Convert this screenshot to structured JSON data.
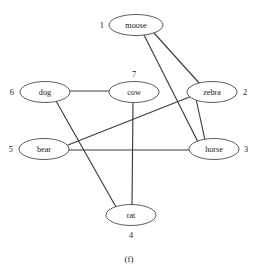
{
  "figure": {
    "caption": "(f)",
    "type": "undirected-graph",
    "width": 258,
    "height": 270,
    "background_color": "#ffffff",
    "node_stroke_color": "#4a4a4a",
    "node_fill_color": "#ffffff",
    "edge_color": "#3c3c3c"
  },
  "graph": {
    "nodes": [
      {
        "id": "moose",
        "label": "moose",
        "index": "1",
        "index_position": "left",
        "cx": 136,
        "cy": 25,
        "rx": 27,
        "ry": 10.5,
        "index_x": 104,
        "index_y": 25
      },
      {
        "id": "zebra",
        "label": "zebra",
        "index": "2",
        "index_position": "right",
        "cx": 212,
        "cy": 92,
        "rx": 25,
        "ry": 10.5,
        "index_x": 243,
        "index_y": 92
      },
      {
        "id": "horse",
        "label": "horse",
        "index": "3",
        "index_position": "right",
        "cx": 214,
        "cy": 149,
        "rx": 25,
        "ry": 10.5,
        "index_x": 244,
        "index_y": 149
      },
      {
        "id": "rat",
        "label": "rat",
        "index": "4",
        "index_position": "below",
        "cx": 131,
        "cy": 215,
        "rx": 25,
        "ry": 10.5,
        "index_x": 131,
        "index_y": 235
      },
      {
        "id": "bear",
        "label": "bear",
        "index": "5",
        "index_position": "left",
        "cx": 44,
        "cy": 149,
        "rx": 25,
        "ry": 10.5,
        "index_x": 13,
        "index_y": 149
      },
      {
        "id": "dog",
        "label": "dog",
        "index": "6",
        "index_position": "left",
        "cx": 45,
        "cy": 92,
        "rx": 25,
        "ry": 10.5,
        "index_x": 14,
        "index_y": 92
      },
      {
        "id": "cow",
        "label": "cow",
        "index": "7",
        "index_position": "above",
        "cx": 134,
        "cy": 92,
        "rx": 25,
        "ry": 10.5,
        "index_x": 134,
        "index_y": 74
      }
    ],
    "edges": [
      {
        "id": "moose-zebra",
        "source": "moose",
        "target": "zebra",
        "x1": 154,
        "y1": 33,
        "x2": 200,
        "y2": 84
      },
      {
        "id": "moose-horse",
        "source": "moose",
        "target": "horse",
        "x1": 144,
        "y1": 35,
        "x2": 198,
        "y2": 142
      },
      {
        "id": "zebra-horse",
        "source": "zebra",
        "target": "horse",
        "x1": 196,
        "y1": 99,
        "x2": 205,
        "y2": 140
      },
      {
        "id": "zebra-bear",
        "source": "zebra",
        "target": "bear",
        "x1": 192,
        "y1": 96,
        "x2": 68,
        "y2": 145
      },
      {
        "id": "bear-horse",
        "source": "bear",
        "target": "horse",
        "x1": 69,
        "y1": 150,
        "x2": 189,
        "y2": 150
      },
      {
        "id": "dog-cow",
        "source": "dog",
        "target": "cow",
        "x1": 70,
        "y1": 91,
        "x2": 109,
        "y2": 91
      },
      {
        "id": "dog-rat",
        "source": "dog",
        "target": "rat",
        "x1": 56,
        "y1": 101,
        "x2": 116,
        "y2": 207
      },
      {
        "id": "cow-rat",
        "source": "cow",
        "target": "rat",
        "x1": 133,
        "y1": 103,
        "x2": 132,
        "y2": 205
      }
    ]
  }
}
